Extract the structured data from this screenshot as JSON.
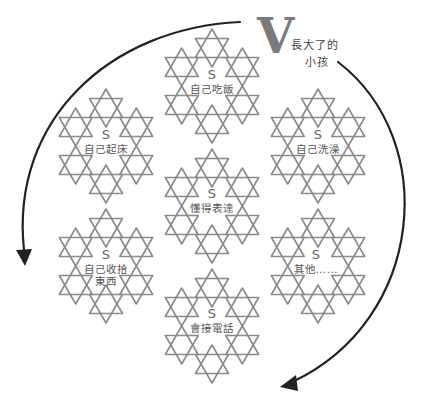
{
  "title": {
    "letter": "V",
    "line1": "長大了的",
    "line2": "小孩"
  },
  "colors": {
    "star_stroke": "#8a8a8a",
    "arrow": "#222222",
    "label": "#555555",
    "big_letter": "#7a7a7a"
  },
  "clusters": [
    {
      "id": "top",
      "s": "S",
      "label": "自己吃飯",
      "label2": ""
    },
    {
      "id": "upper-left",
      "s": "S",
      "label": "自己起床",
      "label2": ""
    },
    {
      "id": "upper-right",
      "s": "S",
      "label": "自己洗澡",
      "label2": ""
    },
    {
      "id": "center",
      "s": "S",
      "label": "懂得表達",
      "label2": ""
    },
    {
      "id": "lower-left",
      "s": "S",
      "label": "自己收拾",
      "label2": "東西"
    },
    {
      "id": "lower-right",
      "s": "S",
      "label": "其他……",
      "label2": ""
    },
    {
      "id": "bottom",
      "s": "S",
      "label": "會接電話",
      "label2": ""
    }
  ],
  "arrows": [
    {
      "id": "left-arc",
      "direction": "counter-clockwise"
    },
    {
      "id": "right-arc",
      "direction": "clockwise"
    }
  ]
}
